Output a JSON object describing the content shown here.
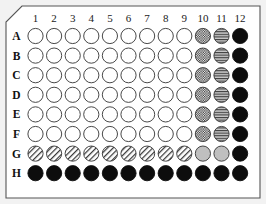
{
  "figure": {
    "background_color": "#f2f2f2",
    "plate_fill": "#ffffff",
    "plate_border_color": "#555555"
  },
  "plate": {
    "format": "96-well",
    "rows": 8,
    "columns": 12,
    "column_headers": [
      "1",
      "2",
      "3",
      "4",
      "5",
      "6",
      "7",
      "8",
      "9",
      "10",
      "11",
      "12"
    ],
    "row_headers": [
      "A",
      "B",
      "C",
      "D",
      "E",
      "F",
      "G",
      "H"
    ],
    "corner_chamfer": "top-left"
  },
  "legend": {
    "fill_types": [
      {
        "key": "empty",
        "label": "empty well",
        "color": "#ffffff"
      },
      {
        "key": "checker",
        "label": "cross-hatched well",
        "color": "#4d4d4d"
      },
      {
        "key": "hstripe",
        "label": "horizontally striped well",
        "color": "#a6a6a6"
      },
      {
        "key": "dstripe",
        "label": "diagonally striped well",
        "color": "#ffffff"
      },
      {
        "key": "solid-gray",
        "label": "solid grey well",
        "color": "#bfbfbf"
      },
      {
        "key": "solid-dark",
        "label": "solid black well",
        "color": "#0d0d0d"
      }
    ]
  },
  "wells": {
    "A": [
      "empty",
      "empty",
      "empty",
      "empty",
      "empty",
      "empty",
      "empty",
      "empty",
      "empty",
      "checker",
      "hstripe",
      "solid-dark"
    ],
    "B": [
      "empty",
      "empty",
      "empty",
      "empty",
      "empty",
      "empty",
      "empty",
      "empty",
      "empty",
      "checker",
      "hstripe",
      "solid-dark"
    ],
    "C": [
      "empty",
      "empty",
      "empty",
      "empty",
      "empty",
      "empty",
      "empty",
      "empty",
      "empty",
      "checker",
      "hstripe",
      "solid-dark"
    ],
    "D": [
      "empty",
      "empty",
      "empty",
      "empty",
      "empty",
      "empty",
      "empty",
      "empty",
      "empty",
      "checker",
      "hstripe",
      "solid-dark"
    ],
    "E": [
      "empty",
      "empty",
      "empty",
      "empty",
      "empty",
      "empty",
      "empty",
      "empty",
      "empty",
      "checker",
      "hstripe",
      "solid-dark"
    ],
    "F": [
      "empty",
      "empty",
      "empty",
      "empty",
      "empty",
      "empty",
      "empty",
      "empty",
      "empty",
      "checker",
      "hstripe",
      "solid-dark"
    ],
    "G": [
      "dstripe",
      "dstripe",
      "dstripe",
      "dstripe",
      "dstripe",
      "dstripe",
      "dstripe",
      "dstripe",
      "dstripe",
      "solid-gray",
      "solid-gray",
      "solid-dark"
    ],
    "H": [
      "solid-dark",
      "solid-dark",
      "solid-dark",
      "solid-dark",
      "solid-dark",
      "solid-dark",
      "solid-dark",
      "solid-dark",
      "solid-dark",
      "solid-dark",
      "solid-dark",
      "solid-dark"
    ]
  },
  "geometry": {
    "plate_x": 6,
    "plate_y": 6,
    "plate_w": 254,
    "plate_h": 192,
    "chamfer": 16,
    "first_col_cx": 35.5,
    "col_pitch": 18.6,
    "first_row_cy": 36.0,
    "row_pitch": 19.6,
    "well_radius": 7.6,
    "col_header_y": 21.5,
    "row_header_x": 16.5
  }
}
